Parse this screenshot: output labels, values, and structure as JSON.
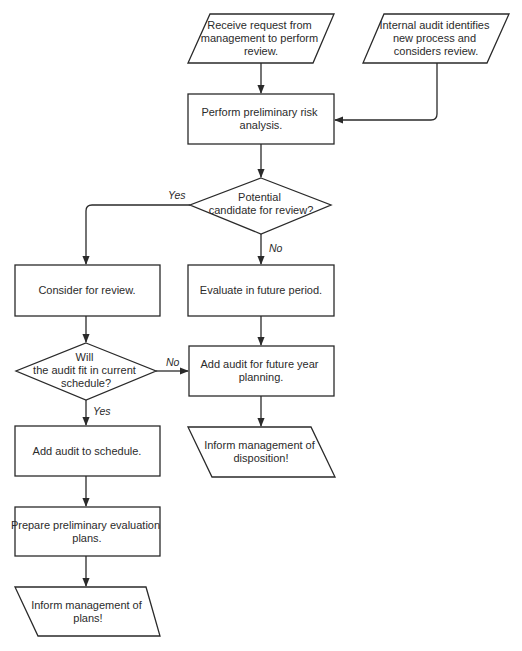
{
  "diagram": {
    "type": "flowchart",
    "colors": {
      "stroke": "#2a2a2a",
      "fill": "#ffffff",
      "text": "#2b2b2b",
      "background": "#ffffff"
    },
    "nodes": [
      {
        "id": "receive-request",
        "shape": "parallelogram",
        "lines": [
          "Receive request from",
          "management to perform",
          "review."
        ]
      },
      {
        "id": "internal-audit",
        "shape": "parallelogram",
        "lines": [
          "Internal audit identifies",
          "new process and",
          "considers review."
        ]
      },
      {
        "id": "risk-analysis",
        "shape": "process",
        "lines": [
          "Perform preliminary risk",
          "analysis."
        ]
      },
      {
        "id": "candidate-decision",
        "shape": "decision",
        "lines": [
          "Potential",
          "candidate for review?"
        ]
      },
      {
        "id": "consider-review",
        "shape": "process",
        "lines": [
          "Consider for review."
        ]
      },
      {
        "id": "evaluate-future",
        "shape": "process",
        "lines": [
          "Evaluate in future period."
        ]
      },
      {
        "id": "fit-decision",
        "shape": "decision",
        "lines": [
          "Will",
          "the audit fit in current",
          "schedule?"
        ]
      },
      {
        "id": "future-year",
        "shape": "process",
        "lines": [
          "Add audit for future year",
          "planning."
        ]
      },
      {
        "id": "add-schedule",
        "shape": "process",
        "lines": [
          "Add audit to schedule."
        ]
      },
      {
        "id": "inform-disposition",
        "shape": "parallelogram",
        "lines": [
          "Inform management of",
          "disposition!"
        ]
      },
      {
        "id": "prepare-plans",
        "shape": "process",
        "lines": [
          "Prepare preliminary evaluation",
          "plans."
        ]
      },
      {
        "id": "inform-plans",
        "shape": "parallelogram",
        "lines": [
          "Inform management of",
          "plans!"
        ]
      }
    ],
    "edges": [
      {
        "from": "receive-request",
        "to": "risk-analysis",
        "label": ""
      },
      {
        "from": "internal-audit",
        "to": "risk-analysis",
        "label": ""
      },
      {
        "from": "risk-analysis",
        "to": "candidate-decision",
        "label": ""
      },
      {
        "from": "candidate-decision",
        "to": "consider-review",
        "label": "Yes"
      },
      {
        "from": "candidate-decision",
        "to": "evaluate-future",
        "label": "No"
      },
      {
        "from": "consider-review",
        "to": "fit-decision",
        "label": ""
      },
      {
        "from": "fit-decision",
        "to": "future-year",
        "label": "No"
      },
      {
        "from": "fit-decision",
        "to": "add-schedule",
        "label": "Yes"
      },
      {
        "from": "evaluate-future",
        "to": "future-year",
        "label": ""
      },
      {
        "from": "future-year",
        "to": "inform-disposition",
        "label": ""
      },
      {
        "from": "add-schedule",
        "to": "prepare-plans",
        "label": ""
      },
      {
        "from": "prepare-plans",
        "to": "inform-plans",
        "label": ""
      }
    ],
    "labels": {
      "candidate_yes": "Yes",
      "candidate_no": "No",
      "fit_no": "No",
      "fit_yes": "Yes"
    }
  }
}
